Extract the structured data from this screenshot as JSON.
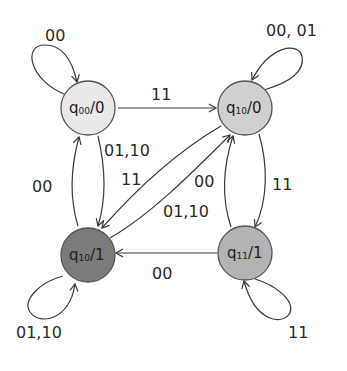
{
  "diagram": {
    "type": "Moore state machine",
    "states": [
      {
        "id": "s00",
        "name": "q",
        "sub": "00",
        "output": "/0",
        "fill": "#e9e9e9"
      },
      {
        "id": "s10a",
        "name": "q",
        "sub": "10",
        "output": "/0",
        "fill": "#d0d0d0"
      },
      {
        "id": "s10b",
        "name": "q",
        "sub": "10",
        "output": "/1",
        "fill": "#7b7b7b"
      },
      {
        "id": "s11",
        "name": "q",
        "sub": "11",
        "output": "/1",
        "fill": "#b3b3b3"
      }
    ],
    "transitions": [
      {
        "from": "s00",
        "to": "s00",
        "label": "00"
      },
      {
        "from": "s00",
        "to": "s10a",
        "label": "11"
      },
      {
        "from": "s00",
        "to": "s10b",
        "label": "01,10"
      },
      {
        "from": "s10b",
        "to": "s00",
        "label": "00"
      },
      {
        "from": "s10a",
        "to": "s10a",
        "label": "00, 01"
      },
      {
        "from": "s10a",
        "to": "s10b",
        "label": "11"
      },
      {
        "from": "s10b",
        "to": "s10a",
        "label": "01,10"
      },
      {
        "from": "s11",
        "to": "s10a",
        "label": "00"
      },
      {
        "from": "s10a",
        "to": "s11",
        "label": "11"
      },
      {
        "from": "s11",
        "to": "s10b",
        "label": "00"
      },
      {
        "from": "s10b",
        "to": "s10b",
        "label": "01,10"
      },
      {
        "from": "s11",
        "to": "s11",
        "label": "11"
      }
    ]
  }
}
